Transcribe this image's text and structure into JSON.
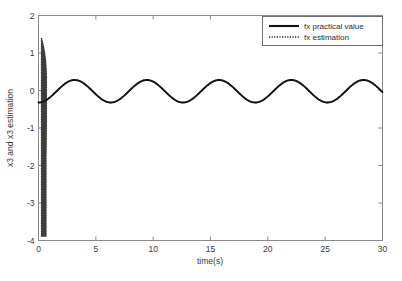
{
  "chart_data": {
    "type": "line",
    "title": "",
    "xlabel": "time(s)",
    "ylabel": "x3 and x3 estimation",
    "xlim": [
      0,
      30
    ],
    "ylim": [
      -4,
      2
    ],
    "xticks": [
      "0",
      "5",
      "10",
      "15",
      "20",
      "25",
      "30"
    ],
    "xtick_values": [
      0,
      5,
      10,
      15,
      20,
      25,
      30
    ],
    "yticks": [
      "2",
      "1",
      "0",
      "-1",
      "-2",
      "-3",
      "-4"
    ],
    "ytick_values": [
      2,
      1,
      0,
      -1,
      -2,
      -3,
      -4
    ],
    "grid": false,
    "legend_position": "top-right-inside",
    "series": [
      {
        "name": "fx practical value",
        "style": "solid",
        "color": "#111111",
        "description": "Steady sinusoid, amplitude about 0.3, period about 6.3 s, mean about -0.02, starting at 0 at t=0",
        "amplitude": 0.3,
        "period": 6.3,
        "offset": -0.02,
        "peak_value": 0.28,
        "trough_value": -0.32,
        "cycles_visible": 5
      },
      {
        "name": "fx estimation",
        "style": "dotted",
        "color": "#2a2a2a",
        "description": "Large initial transient oscillation between +1.4 and -3.9 for t from about 0.25 to 0.7 s, then converges onto the practical value sinusoid",
        "transient_t_start": 0.25,
        "transient_t_end": 0.7,
        "transient_max": 1.4,
        "transient_min": -3.9,
        "amplitude": 0.3,
        "period": 6.3,
        "offset": -0.02
      }
    ]
  },
  "legend": {
    "entries": [
      {
        "label": "fx practical value",
        "marker": "solid-line-sample"
      },
      {
        "label": "fx estimation",
        "marker": "dotted-line-sample"
      }
    ]
  },
  "axes": {
    "x_axis_label": "time(s)",
    "y_axis_label": "x3 and x3 estimation"
  },
  "colors": {
    "background": "#ffffff",
    "axis": "#8a8a8a",
    "text": "#3a3a3a",
    "practical_series": "#111111",
    "estimation_series": "#2a2a2a"
  }
}
